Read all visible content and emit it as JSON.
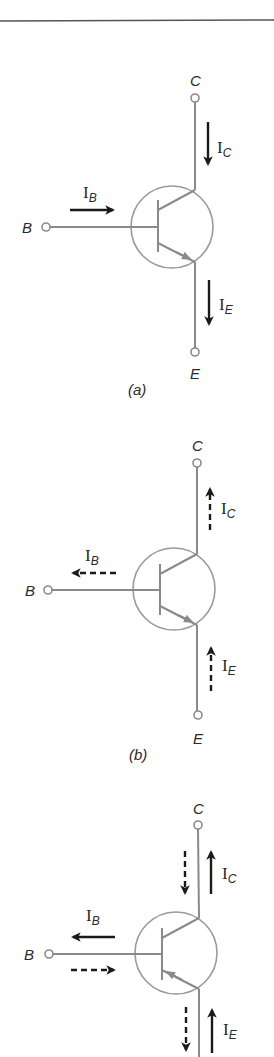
{
  "figure": {
    "rule_color": "#555555",
    "wire_color": "#8a8a8a",
    "arrow_color": "#1a1a1a",
    "panels": [
      {
        "id": "a",
        "caption": "(a)",
        "type": "NPN",
        "terminals": {
          "collector": "C",
          "base": "B",
          "emitter": "E"
        },
        "currents": {
          "base": {
            "label": "I",
            "sub": "B",
            "direction": "in",
            "style": "solid"
          },
          "collector": {
            "label": "I",
            "sub": "C",
            "direction": "in",
            "style": "solid"
          },
          "emitter": {
            "label": "I",
            "sub": "E",
            "direction": "out",
            "style": "solid"
          }
        }
      },
      {
        "id": "b",
        "caption": "(b)",
        "type": "NPN",
        "terminals": {
          "collector": "C",
          "base": "B",
          "emitter": "E"
        },
        "currents": {
          "base": {
            "label": "I",
            "sub": "B",
            "direction": "out",
            "style": "dashed"
          },
          "collector": {
            "label": "I",
            "sub": "C",
            "direction": "out",
            "style": "dashed"
          },
          "emitter": {
            "label": "I",
            "sub": "E",
            "direction": "in",
            "style": "dashed"
          }
        }
      },
      {
        "id": "c",
        "caption": "",
        "type": "PNP",
        "terminals": {
          "collector": "C",
          "base": "B",
          "emitter": ""
        },
        "currents": {
          "base": {
            "label": "I",
            "sub": "B",
            "direction": "out",
            "style": "solid",
            "secondary": "in-dashed"
          },
          "collector": {
            "label": "I",
            "sub": "C",
            "direction": "out",
            "style": "solid",
            "secondary": "in-dashed"
          },
          "emitter": {
            "label": "I",
            "sub": "E",
            "direction": "in",
            "style": "solid",
            "secondary": "out-dashed"
          }
        }
      }
    ]
  }
}
